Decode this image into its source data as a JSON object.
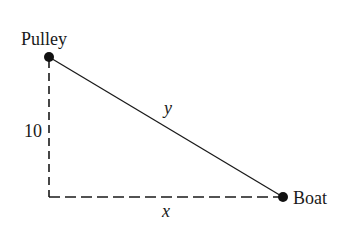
{
  "diagram": {
    "type": "right-triangle pulley-boat problem",
    "labels": {
      "pulley": "Pulley",
      "boat": "Boat",
      "height": "10",
      "hypotenuse": "y",
      "base": "x"
    },
    "points": {
      "pulley": {
        "x": 49,
        "y": 57
      },
      "corner": {
        "x": 49,
        "y": 197
      },
      "boat": {
        "x": 283,
        "y": 197
      }
    },
    "segments": [
      {
        "name": "rope",
        "from": "pulley",
        "to": "boat",
        "style": "solid",
        "label": "y"
      },
      {
        "name": "height",
        "from": "pulley",
        "to": "corner",
        "style": "dashed",
        "label": "10"
      },
      {
        "name": "distance",
        "from": "corner",
        "to": "boat",
        "style": "dashed",
        "label": "x"
      }
    ],
    "colors": {
      "line": "#1a1a1a",
      "background": "#ffffff"
    }
  }
}
